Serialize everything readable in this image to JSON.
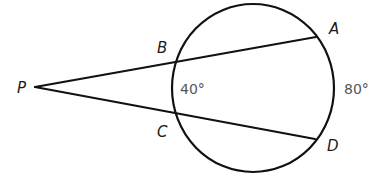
{
  "diagram": {
    "type": "secant-secant angle",
    "circle": {
      "cx": 253,
      "cy": 88,
      "rx": 81,
      "ry": 84
    },
    "points": {
      "P": {
        "label": "P",
        "x": 35,
        "y": 87
      },
      "A": {
        "label": "A",
        "x": 316,
        "y": 37
      },
      "B": {
        "label": "B",
        "x": 176,
        "y": 61
      },
      "C": {
        "label": "C",
        "x": 176,
        "y": 113
      },
      "D": {
        "label": "D",
        "x": 315,
        "y": 139
      }
    },
    "segments": [
      {
        "from": "P",
        "to": "A"
      },
      {
        "from": "P",
        "to": "D"
      }
    ],
    "arcs": {
      "BC": {
        "measure": "40°"
      },
      "AD": {
        "measure": "80°"
      }
    }
  }
}
